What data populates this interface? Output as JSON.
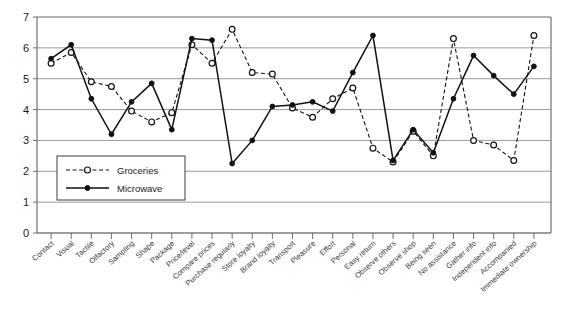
{
  "chart_data": {
    "type": "line",
    "title": "",
    "subtitle": "",
    "xlabel": "",
    "ylabel": "",
    "ylim": [
      0,
      7
    ],
    "yticks": [
      0,
      1,
      2,
      3,
      4,
      5,
      6,
      7
    ],
    "grid": true,
    "legend_position": "inside-bottom-left",
    "categories": [
      "Contact",
      "Visual",
      "Tactile",
      "Olfactory",
      "Sampling",
      "Shape",
      "Package",
      "Price/level",
      "Compare prices",
      "Purchase regularly",
      "Store loyalty",
      "Brand loyalty",
      "Transport",
      "Pleasure",
      "Effort",
      "Personal",
      "Easy return",
      "Observe others",
      "Observe shop",
      "Being seen",
      "No assistance",
      "Gather info",
      "Independent info",
      "Accompanied",
      "Immediate ownership"
    ],
    "series": [
      {
        "name": "Groceries",
        "marker": "open-circle",
        "line": "dashed",
        "values": [
          5.5,
          5.85,
          4.9,
          4.75,
          3.95,
          3.6,
          3.9,
          6.1,
          5.5,
          6.6,
          5.2,
          5.15,
          4.05,
          3.75,
          4.35,
          4.7,
          2.75,
          2.3,
          3.3,
          2.5,
          6.3,
          3.0,
          2.85,
          2.35,
          6.4
        ]
      },
      {
        "name": "Microwave",
        "marker": "filled-circle",
        "line": "solid",
        "values": [
          5.65,
          6.1,
          4.35,
          3.2,
          4.25,
          4.85,
          3.35,
          6.3,
          6.25,
          2.25,
          3.0,
          4.1,
          4.15,
          4.25,
          3.95,
          5.2,
          6.4,
          2.35,
          3.35,
          2.6,
          4.35,
          5.75,
          5.1,
          4.5,
          5.4
        ]
      }
    ]
  },
  "legend": {
    "items": [
      {
        "label": "Groceries",
        "style": "dashed-open-circle"
      },
      {
        "label": "Microwave",
        "style": "solid-filled-circle"
      }
    ]
  },
  "axes": {
    "y_tick_labels": [
      "0",
      "1",
      "2",
      "3",
      "4",
      "5",
      "6",
      "7"
    ]
  },
  "colors": {
    "series_stroke": "#111111",
    "gridline": "#9a9a9a",
    "axis": "#6f6f6f",
    "background": "#ffffff",
    "marker_fill_open": "#ffffff",
    "label_text": "#3a3a3a"
  }
}
